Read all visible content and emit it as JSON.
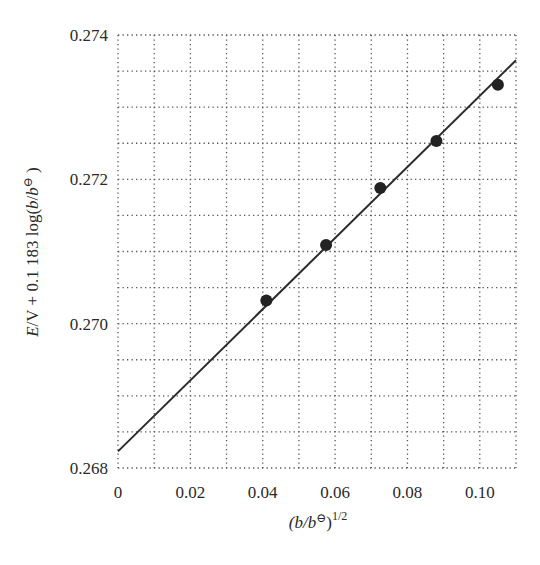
{
  "chart_data": {
    "type": "scatter",
    "title": "",
    "xlabel": "(b/b⦵)^1/2",
    "xlabel_parts": {
      "base": "(b/b",
      "std": "⊖",
      "close": ")",
      "sup": "1/2"
    },
    "ylabel": "E/V + 0.1183 log(b/b⦵)",
    "ylabel_parts": {
      "e": "E",
      "rest": "/V + 0.1 183 log(",
      "b1": "b",
      "slash": "/",
      "b2": "b",
      "std": "⊖",
      "close": " )"
    },
    "xlim": [
      0,
      0.11
    ],
    "ylim": [
      0.268,
      0.274
    ],
    "x_ticks": [
      0,
      0.02,
      0.04,
      0.06,
      0.08,
      0.1
    ],
    "x_tick_labels": [
      "0",
      "0.02",
      "0.04",
      "0.06",
      "0.08",
      "0.10"
    ],
    "y_ticks": [
      0.268,
      0.27,
      0.272,
      0.274
    ],
    "y_tick_labels": [
      "0.268",
      "0.270",
      "0.272",
      "0.274"
    ],
    "grid": true,
    "grid_x_step": 0.01,
    "grid_y_step": 0.0005,
    "grid_style": "dotted",
    "legend": null,
    "series": [
      {
        "name": "measured",
        "type": "scatter",
        "x": [
          0.041,
          0.0575,
          0.0725,
          0.088,
          0.105
        ],
        "y": [
          0.27032,
          0.27109,
          0.27188,
          0.27253,
          0.27331
        ]
      },
      {
        "name": "linear fit",
        "type": "line",
        "x": [
          0,
          0.11
        ],
        "y": [
          0.26823,
          0.27365
        ]
      }
    ],
    "colors": {
      "points": "#222222",
      "line": "#2b2b2b",
      "grid": "#555555"
    }
  }
}
